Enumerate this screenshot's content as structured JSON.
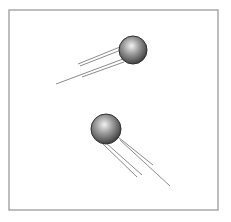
{
  "figure": {
    "frame": {
      "x": 9,
      "y": 10,
      "width": 209,
      "height": 200,
      "stroke": "#a8a8a8"
    },
    "colors": {
      "sphere_highlight": "#f2f2f2",
      "sphere_mid": "#9a9a9a",
      "sphere_shadow": "#3a3a3a",
      "sphere_outline": "#2e2e2e",
      "motion_line": "#8c8c8c"
    },
    "spheres": [
      {
        "name": "upper-sphere",
        "cx": 133,
        "cy": 50,
        "r": 14,
        "motion_lines": [
          {
            "x1": 78,
            "y1": 64,
            "x2": 120,
            "y2": 47
          },
          {
            "x1": 80,
            "y1": 66,
            "x2": 121,
            "y2": 50
          },
          {
            "x1": 56,
            "y1": 84,
            "x2": 123,
            "y2": 59
          },
          {
            "x1": 82,
            "y1": 77,
            "x2": 124,
            "y2": 62
          }
        ]
      },
      {
        "name": "lower-sphere",
        "cx": 106,
        "cy": 129,
        "r": 15,
        "motion_lines": [
          {
            "x1": 106,
            "y1": 143,
            "x2": 142,
            "y2": 175
          },
          {
            "x1": 103,
            "y1": 144,
            "x2": 137,
            "y2": 177
          },
          {
            "x1": 118,
            "y1": 137,
            "x2": 153,
            "y2": 165
          },
          {
            "x1": 120,
            "y1": 140,
            "x2": 170,
            "y2": 186
          }
        ]
      }
    ]
  }
}
